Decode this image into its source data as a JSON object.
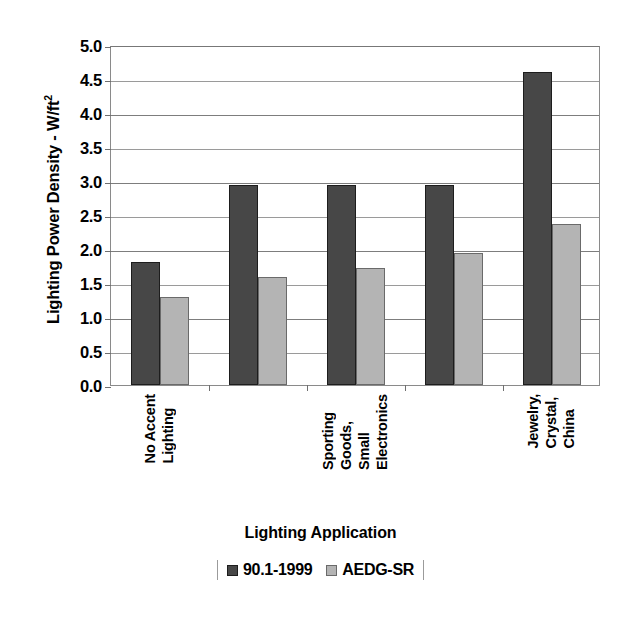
{
  "chart_data": {
    "type": "bar",
    "title": "",
    "xlabel": "Lighting Application",
    "ylabel": "Lighting Power Density - W/ft²",
    "ylabel_base": "Lighting Power Density - W/ft",
    "ylabel_sup": "2",
    "ylim": [
      0.0,
      5.0
    ],
    "ytick_step": 0.5,
    "ytick_labels": [
      "5.0",
      "4.5",
      "4.0",
      "3.5",
      "3.0",
      "2.5",
      "2.0",
      "1.5",
      "1.0",
      "0.5",
      "0.0"
    ],
    "ytick_values": [
      5.0,
      4.5,
      4.0,
      3.5,
      3.0,
      2.5,
      2.0,
      1.5,
      1.0,
      0.5,
      0.0
    ],
    "grid": true,
    "grid_axis": "y",
    "legend_position": "bottom",
    "categories": [
      "No Accent Lighting",
      "",
      "Sporting Goods, Small Electronics",
      "",
      "Jewelry, Crystal, China"
    ],
    "category_label_lines": [
      [
        "No Accent",
        "Lighting"
      ],
      [],
      [
        "Sporting",
        "Goods,",
        "Small",
        "Electronics"
      ],
      [],
      [
        "Jewelry,",
        "Crystal,",
        "China"
      ]
    ],
    "series": [
      {
        "name": "90.1-1999",
        "color": "#474747",
        "values": [
          1.81,
          2.94,
          2.94,
          2.94,
          4.6
        ]
      },
      {
        "name": "AEDG-SR",
        "color": "#b4b4b4",
        "values": [
          1.29,
          1.59,
          1.72,
          1.94,
          2.37
        ]
      }
    ]
  },
  "axis_title": {
    "x": "Lighting Application"
  },
  "legend": {
    "entries": [
      {
        "label": "90.1-1999",
        "swatch": "dark-gray-swatch"
      },
      {
        "label": "AEDG-SR",
        "swatch": "light-gray-swatch"
      }
    ]
  }
}
